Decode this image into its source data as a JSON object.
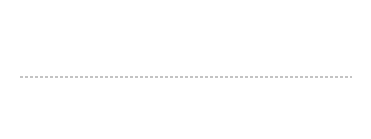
{
  "colors": {
    "box_stroke": "#888888",
    "box_fill": "#fafafa",
    "dot_filled": "#1a1a1a",
    "dot_empty_stroke": "#b8b8b8",
    "arrow": "#555555",
    "separator": "#888888",
    "label": "#333333"
  },
  "layout_note": "Each die has 7 positions: TL, TR, ML, C, MR, BL, BR",
  "dice": [
    {
      "label": "1",
      "filled": [
        "C"
      ]
    },
    {
      "label": "2",
      "filled": [
        "TL",
        "BR"
      ]
    },
    {
      "label": "3",
      "filled": [
        "TR",
        "C",
        "BL"
      ]
    },
    {
      "label": "4",
      "filled": [
        "TL",
        "TR",
        "BL",
        "BR"
      ]
    },
    {
      "label": "5",
      "filled": [
        "TL",
        "TR",
        "C",
        "BL",
        "BR"
      ]
    },
    {
      "label": "6",
      "filled": [
        "TL",
        "TR",
        "ML",
        "MR",
        "BL",
        "BR"
      ]
    }
  ],
  "transforms": [
    {
      "label": "W",
      "filled": [
        "ML",
        "MR"
      ],
      "arrows_from": [
        "ML",
        "MR"
      ]
    },
    {
      "label": "X",
      "filled": [
        "C"
      ],
      "arrows_from": [
        "C"
      ]
    },
    {
      "label": "Y",
      "filled": [
        "TR",
        "BL"
      ],
      "arrows_from": [
        "TR",
        "BL"
      ]
    },
    {
      "label": "Z",
      "filled": [
        "TL",
        "BR"
      ],
      "arrows_from": [
        "TL",
        "BR"
      ]
    }
  ]
}
